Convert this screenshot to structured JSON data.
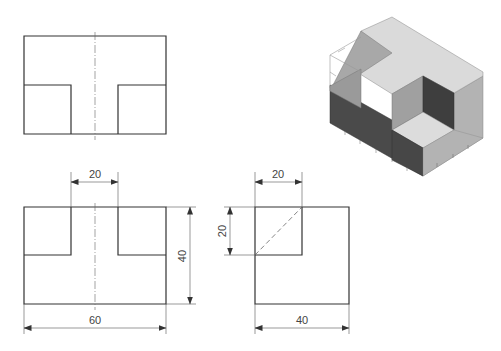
{
  "drawing": {
    "title": "Orthographic projection with isometric view",
    "views": [
      "top-view",
      "front-view",
      "side-view",
      "isometric-view"
    ]
  },
  "dimensions": {
    "front_notch_gap": "20",
    "front_height": "40",
    "front_width": "60",
    "side_top_width": "20",
    "side_left_height": "20",
    "side_width": "40"
  },
  "colors": {
    "line": "#333333",
    "iso_top_light": "#d9d9d9",
    "iso_mid_gray": "#a6a6a6",
    "iso_dark": "#4a4a4a",
    "iso_right_face": "#b0b0b0"
  }
}
